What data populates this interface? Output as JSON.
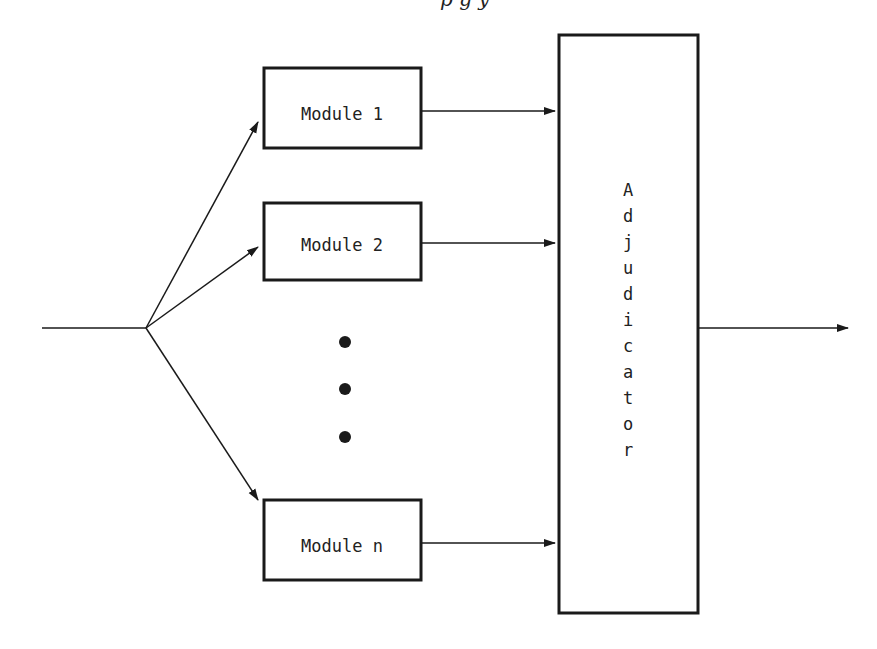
{
  "caption_fragment": "p   g  y",
  "input_label": "",
  "modules": [
    {
      "label": "Module 1"
    },
    {
      "label": "Module 2"
    },
    {
      "label": "Module n"
    }
  ],
  "ellipsis": [
    "•",
    "•",
    "•"
  ],
  "adjudicator": {
    "label": "Adjudicator",
    "letters": [
      "A",
      "d",
      "j",
      "u",
      "d",
      "i",
      "c",
      "a",
      "t",
      "o",
      "r"
    ]
  },
  "colors": {
    "stroke": "#1a1a1a",
    "background": "#ffffff"
  }
}
